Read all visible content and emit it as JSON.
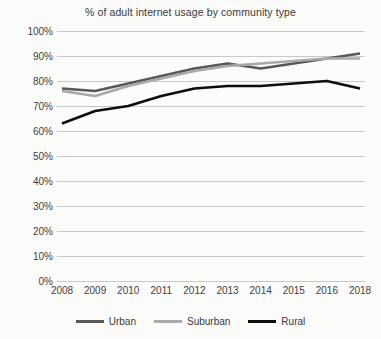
{
  "chart_data": {
    "type": "line",
    "title": "% of adult internet usage by community type",
    "xlabel": "",
    "ylabel": "",
    "categories": [
      "2008",
      "2009",
      "2010",
      "2011",
      "2012",
      "2013",
      "2014",
      "2015",
      "2016",
      "2018"
    ],
    "ylim": [
      0,
      100
    ],
    "yticks": [
      "0%",
      "10%",
      "20%",
      "30%",
      "40%",
      "50%",
      "60%",
      "70%",
      "80%",
      "90%",
      "100%"
    ],
    "ytick_values": [
      0,
      10,
      20,
      30,
      40,
      50,
      60,
      70,
      80,
      90,
      100
    ],
    "grid": true,
    "legend_position": "bottom",
    "series": [
      {
        "name": "Urban",
        "color": "#585858",
        "values": [
          77,
          76,
          79,
          82,
          85,
          87,
          85,
          87,
          89,
          91
        ]
      },
      {
        "name": "Suburban",
        "color": "#a9a9a9",
        "values": [
          76,
          74,
          78,
          81,
          84,
          86,
          87,
          88,
          89,
          89
        ]
      },
      {
        "name": "Rural",
        "color": "#0d0d0d",
        "values": [
          63,
          68,
          70,
          74,
          77,
          78,
          78,
          79,
          80,
          77
        ]
      }
    ]
  }
}
